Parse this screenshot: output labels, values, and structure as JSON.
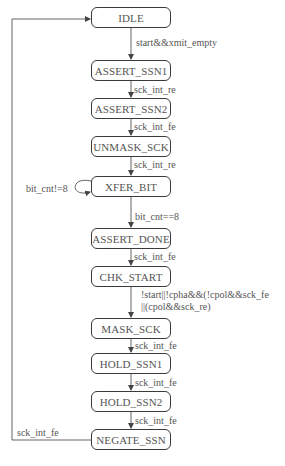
{
  "diagram": {
    "type": "state-machine",
    "states": [
      {
        "id": "idle",
        "label": "IDLE",
        "top": 7
      },
      {
        "id": "assert_ssn1",
        "label": "ASSERT_SSN1",
        "top": 60
      },
      {
        "id": "assert_ssn2",
        "label": "ASSERT_SSN2",
        "top": 98
      },
      {
        "id": "unmask_sck",
        "label": "UNMASK_SCK",
        "top": 136
      },
      {
        "id": "xfer_bit",
        "label": "XFER_BIT",
        "top": 176
      },
      {
        "id": "assert_done",
        "label": "ASSERT_DONE",
        "top": 228
      },
      {
        "id": "chk_start",
        "label": "CHK_START",
        "top": 266
      },
      {
        "id": "mask_sck",
        "label": "MASK_SCK",
        "top": 318
      },
      {
        "id": "hold_ssn1",
        "label": "HOLD_SSN1",
        "top": 353
      },
      {
        "id": "hold_ssn2",
        "label": "HOLD_SSN2",
        "top": 391
      },
      {
        "id": "negate_ssn",
        "label": "NEGATE_SSN",
        "top": 429
      }
    ],
    "transitions": [
      {
        "from": "IDLE",
        "to": "ASSERT_SSN1",
        "label": "start&&xmit_empty"
      },
      {
        "from": "ASSERT_SSN1",
        "to": "ASSERT_SSN2",
        "label": "sck_int_re"
      },
      {
        "from": "ASSERT_SSN2",
        "to": "UNMASK_SCK",
        "label": "sck_int_fe"
      },
      {
        "from": "UNMASK_SCK",
        "to": "XFER_BIT",
        "label": "sck_int_re"
      },
      {
        "from": "XFER_BIT",
        "to": "XFER_BIT",
        "label": "bit_cnt!=8"
      },
      {
        "from": "XFER_BIT",
        "to": "ASSERT_DONE",
        "label": "bit_cnt==8"
      },
      {
        "from": "ASSERT_DONE",
        "to": "CHK_START",
        "label": "sck_int_fe"
      },
      {
        "from": "CHK_START",
        "to": "MASK_SCK",
        "label_line1": "!start||!cpha&&(!cpol&&sck_fe",
        "label_line2": "||(cpol&&sck_re)"
      },
      {
        "from": "MASK_SCK",
        "to": "HOLD_SSN1",
        "label": "sck_int_fe"
      },
      {
        "from": "HOLD_SSN1",
        "to": "HOLD_SSN2",
        "label": "sck_int_fe"
      },
      {
        "from": "HOLD_SSN2",
        "to": "NEGATE_SSN",
        "label": "sck_int_fe"
      },
      {
        "from": "NEGATE_SSN",
        "to": "IDLE",
        "label": "sck_int_fe"
      }
    ]
  }
}
